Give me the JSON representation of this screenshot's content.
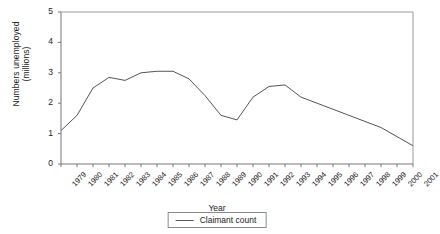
{
  "chart_data": {
    "type": "line",
    "title": "",
    "xlabel": "Year",
    "ylabel": "Numbers unemployed (millions)",
    "ylabel_line1": "Numbers unemployed",
    "ylabel_line2": "(millions)",
    "ylim": [
      0,
      5
    ],
    "yticks": [
      0,
      1,
      2,
      3,
      4,
      5
    ],
    "ytick_labels": [
      "0",
      "1",
      "2",
      "3",
      "4",
      "5"
    ],
    "grid": false,
    "legend_position": "bottom-center",
    "categories": [
      "1979",
      "1980",
      "1981",
      "1982",
      "1983",
      "1984",
      "1985",
      "1986",
      "1987",
      "1988",
      "1989",
      "1990",
      "1991",
      "1992",
      "1993",
      "1994",
      "1995",
      "1996",
      "1997",
      "1998",
      "1999",
      "2000",
      "2001"
    ],
    "series": [
      {
        "name": "Claimant count",
        "color": "#555555",
        "values": [
          1.1,
          1.6,
          2.5,
          2.85,
          2.75,
          3.0,
          3.05,
          3.05,
          2.8,
          2.25,
          1.6,
          1.45,
          2.2,
          2.55,
          2.6,
          2.2,
          2.0,
          1.8,
          1.6,
          1.4,
          1.2,
          0.9,
          0.6
        ]
      }
    ]
  },
  "legend": {
    "entries": [
      {
        "label": "Claimant count"
      }
    ]
  }
}
